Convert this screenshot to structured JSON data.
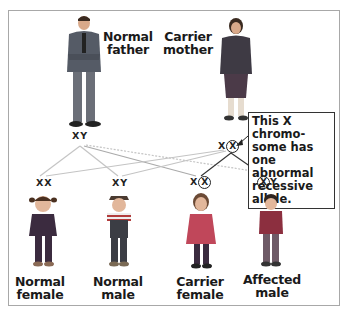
{
  "parents": {
    "father": {
      "label_line1": "Normal",
      "label_line2": "father",
      "genotype": "XY"
    },
    "mother": {
      "label_line1": "Carrier",
      "label_line2": "mother",
      "genotype_normal": "X",
      "genotype_abnormal": "X"
    }
  },
  "callout": {
    "text": "This X chromo-some has one abnormal recessive allele."
  },
  "offspring": [
    {
      "genotype": "XX",
      "label_line1": "Normal",
      "label_line2": "female"
    },
    {
      "genotype": "XY",
      "label_line1": "Normal",
      "label_line2": "male"
    },
    {
      "genotype_normal": "X",
      "genotype_abnormal": "X",
      "label_line1": "Carrier",
      "label_line2": "female"
    },
    {
      "genotype_abnormal": "X",
      "genotype_y": "Y",
      "label_line1": "Affected",
      "label_line2": "male"
    }
  ],
  "colors": {
    "frame": "#a8a8a8",
    "inheritance_line_normal": "#c4c4c4",
    "inheritance_line_abnormal": "#333333",
    "text": "#1a1a1a"
  }
}
